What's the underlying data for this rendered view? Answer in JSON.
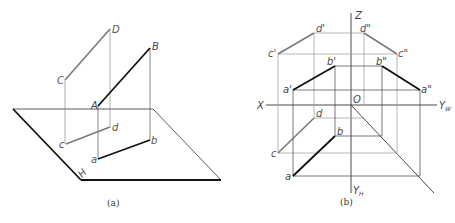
{
  "figure_a": {
    "caption": "(a)",
    "points_space": {
      "A": "A",
      "B": "B",
      "C": "C",
      "D": "D"
    },
    "points_plane": {
      "a": "a",
      "b": "b",
      "c": "c",
      "d": "d"
    },
    "plane_label": "H"
  },
  "figure_b": {
    "caption": "(b)",
    "axes": {
      "Z": "Z",
      "X": "X",
      "O": "O",
      "YW": "Y",
      "YW_sub": "W",
      "YH": "Y",
      "YH_sub": "H"
    },
    "front_view": {
      "a": "a'",
      "b": "b'",
      "c": "c'",
      "d": "d'"
    },
    "side_view": {
      "a": "a\"",
      "b": "b\"",
      "c": "c\"",
      "d": "d\""
    },
    "top_view": {
      "a": "a",
      "b": "b",
      "c": "c",
      "d": "d"
    }
  },
  "colors": {
    "line_ab": "#111111",
    "line_cd": "#7a7a7a",
    "projection": "#8a8a8a",
    "axis": "#333333",
    "plane": "#222222"
  }
}
